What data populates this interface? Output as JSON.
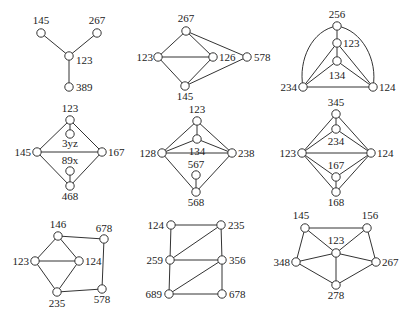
{
  "figure": {
    "node_radius": 4.2,
    "colors": {
      "stroke": "#333333",
      "node_fill": "#ffffff",
      "text": "#222222",
      "background": "#ffffff"
    }
  },
  "graphs": [
    {
      "id": "g1",
      "nodes": [
        {
          "id": "145",
          "x": 41,
          "y": 33,
          "lx": 41,
          "ly": 24,
          "anchor": "middle"
        },
        {
          "id": "267",
          "x": 97,
          "y": 33,
          "lx": 97,
          "ly": 24,
          "anchor": "middle"
        },
        {
          "id": "123",
          "x": 69,
          "y": 56,
          "lx": 76,
          "ly": 64,
          "anchor": "start"
        },
        {
          "id": "389",
          "x": 69,
          "y": 87,
          "lx": 76,
          "ly": 91,
          "anchor": "start"
        }
      ],
      "edges": [
        [
          "145",
          "123"
        ],
        [
          "267",
          "123"
        ],
        [
          "123",
          "389"
        ]
      ],
      "arcs": []
    },
    {
      "id": "g2",
      "nodes": [
        {
          "id": "267",
          "x": 186,
          "y": 31,
          "lx": 186,
          "ly": 22,
          "anchor": "middle"
        },
        {
          "id": "123",
          "x": 158,
          "y": 57,
          "lx": 153,
          "ly": 61,
          "anchor": "end"
        },
        {
          "id": "126",
          "x": 213,
          "y": 57,
          "lx": 219,
          "ly": 61,
          "anchor": "start"
        },
        {
          "id": "578",
          "x": 247,
          "y": 57,
          "lx": 254,
          "ly": 61,
          "anchor": "start"
        },
        {
          "id": "145",
          "x": 185,
          "y": 86,
          "lx": 185,
          "ly": 100,
          "anchor": "middle"
        }
      ],
      "edges": [
        [
          "267",
          "123"
        ],
        [
          "267",
          "126"
        ],
        [
          "267",
          "578"
        ],
        [
          "123",
          "126"
        ],
        [
          "123",
          "145"
        ],
        [
          "126",
          "145"
        ],
        [
          "145",
          "578"
        ]
      ],
      "arcs": []
    },
    {
      "id": "g3",
      "nodes": [
        {
          "id": "256",
          "x": 337,
          "y": 26,
          "lx": 337,
          "ly": 18,
          "anchor": "middle"
        },
        {
          "id": "123",
          "x": 337,
          "y": 43,
          "lx": 343,
          "ly": 47,
          "anchor": "start"
        },
        {
          "id": "134",
          "x": 337,
          "y": 61,
          "lx": 337,
          "ly": 79,
          "anchor": "middle"
        },
        {
          "id": "234",
          "x": 303,
          "y": 87,
          "lx": 297,
          "ly": 91,
          "anchor": "end"
        },
        {
          "id": "124",
          "x": 373,
          "y": 87,
          "lx": 379,
          "ly": 91,
          "anchor": "start"
        }
      ],
      "edges": [
        [
          "256",
          "123"
        ],
        [
          "123",
          "134"
        ],
        [
          "123",
          "234"
        ],
        [
          "123",
          "124"
        ],
        [
          "134",
          "234"
        ],
        [
          "134",
          "124"
        ],
        [
          "234",
          "124"
        ]
      ],
      "arcs": [
        {
          "from": "256",
          "to": "234",
          "path": "M337,26 C312,30 298,60 303,87"
        },
        {
          "from": "256",
          "to": "124",
          "path": "M337,26 C362,30 378,60 373,87"
        }
      ]
    },
    {
      "id": "g4",
      "nodes": [
        {
          "id": "123",
          "x": 70,
          "y": 120,
          "lx": 70,
          "ly": 112,
          "anchor": "middle"
        },
        {
          "id": "3yz",
          "x": 70,
          "y": 134,
          "lx": 70,
          "ly": 147,
          "anchor": "middle"
        },
        {
          "id": "145",
          "x": 37,
          "y": 152,
          "lx": 31,
          "ly": 156,
          "anchor": "end"
        },
        {
          "id": "167",
          "x": 102,
          "y": 152,
          "lx": 108,
          "ly": 156,
          "anchor": "start"
        },
        {
          "id": "89x",
          "x": 70,
          "y": 171,
          "lx": 70,
          "ly": 164,
          "anchor": "middle"
        },
        {
          "id": "468",
          "x": 70,
          "y": 186,
          "lx": 70,
          "ly": 200,
          "anchor": "middle"
        }
      ],
      "edges": [
        [
          "123",
          "3yz"
        ],
        [
          "123",
          "145"
        ],
        [
          "123",
          "167"
        ],
        [
          "145",
          "167"
        ],
        [
          "145",
          "468"
        ],
        [
          "167",
          "468"
        ],
        [
          "89x",
          "468"
        ]
      ],
      "arcs": []
    },
    {
      "id": "g5",
      "nodes": [
        {
          "id": "123",
          "x": 197,
          "y": 121,
          "lx": 197,
          "ly": 113,
          "anchor": "middle"
        },
        {
          "id": "134",
          "x": 197,
          "y": 139,
          "lx": 197,
          "ly": 155,
          "anchor": "middle"
        },
        {
          "id": "128",
          "x": 162,
          "y": 153,
          "lx": 156,
          "ly": 157,
          "anchor": "end"
        },
        {
          "id": "238",
          "x": 232,
          "y": 153,
          "lx": 238,
          "ly": 157,
          "anchor": "start"
        },
        {
          "id": "567",
          "x": 196,
          "y": 175,
          "lx": 196,
          "ly": 168,
          "anchor": "middle"
        },
        {
          "id": "568",
          "x": 196,
          "y": 192,
          "lx": 196,
          "ly": 206,
          "anchor": "middle"
        }
      ],
      "edges": [
        [
          "123",
          "134"
        ],
        [
          "123",
          "128"
        ],
        [
          "123",
          "238"
        ],
        [
          "134",
          "128"
        ],
        [
          "134",
          "238"
        ],
        [
          "128",
          "238"
        ],
        [
          "128",
          "568"
        ],
        [
          "238",
          "568"
        ],
        [
          "567",
          "568"
        ]
      ],
      "arcs": []
    },
    {
      "id": "g6",
      "nodes": [
        {
          "id": "345",
          "x": 336,
          "y": 114,
          "lx": 336,
          "ly": 106,
          "anchor": "middle"
        },
        {
          "id": "234",
          "x": 336,
          "y": 129,
          "lx": 336,
          "ly": 145,
          "anchor": "middle"
        },
        {
          "id": "123",
          "x": 302,
          "y": 153,
          "lx": 296,
          "ly": 157,
          "anchor": "end"
        },
        {
          "id": "124",
          "x": 371,
          "y": 153,
          "lx": 377,
          "ly": 157,
          "anchor": "start"
        },
        {
          "id": "167",
          "x": 336,
          "y": 177,
          "lx": 336,
          "ly": 169,
          "anchor": "middle"
        },
        {
          "id": "168",
          "x": 336,
          "y": 192,
          "lx": 336,
          "ly": 206,
          "anchor": "middle"
        }
      ],
      "edges": [
        [
          "345",
          "234"
        ],
        [
          "345",
          "123"
        ],
        [
          "345",
          "124"
        ],
        [
          "234",
          "123"
        ],
        [
          "234",
          "124"
        ],
        [
          "123",
          "124"
        ],
        [
          "123",
          "167"
        ],
        [
          "124",
          "167"
        ],
        [
          "123",
          "168"
        ],
        [
          "124",
          "168"
        ],
        [
          "167",
          "168"
        ]
      ],
      "arcs": []
    },
    {
      "id": "g7",
      "nodes": [
        {
          "id": "146",
          "x": 58,
          "y": 236,
          "lx": 58,
          "ly": 228,
          "anchor": "middle"
        },
        {
          "id": "678",
          "x": 104,
          "y": 239,
          "lx": 104,
          "ly": 232,
          "anchor": "middle"
        },
        {
          "id": "123",
          "x": 35,
          "y": 261,
          "lx": 29,
          "ly": 265,
          "anchor": "end"
        },
        {
          "id": "124",
          "x": 79,
          "y": 261,
          "lx": 85,
          "ly": 265,
          "anchor": "start"
        },
        {
          "id": "235",
          "x": 57,
          "y": 292,
          "lx": 57,
          "ly": 307,
          "anchor": "middle"
        },
        {
          "id": "578",
          "x": 102,
          "y": 289,
          "lx": 102,
          "ly": 303,
          "anchor": "middle"
        }
      ],
      "edges": [
        [
          "146",
          "123"
        ],
        [
          "146",
          "124"
        ],
        [
          "146",
          "678"
        ],
        [
          "123",
          "124"
        ],
        [
          "123",
          "235"
        ],
        [
          "124",
          "235"
        ],
        [
          "678",
          "578"
        ],
        [
          "235",
          "578"
        ]
      ],
      "arcs": []
    },
    {
      "id": "g8",
      "nodes": [
        {
          "id": "124",
          "x": 171,
          "y": 225,
          "lx": 164,
          "ly": 229,
          "anchor": "end"
        },
        {
          "id": "235",
          "x": 221,
          "y": 225,
          "lx": 228,
          "ly": 229,
          "anchor": "start"
        },
        {
          "id": "259",
          "x": 170,
          "y": 260,
          "lx": 163,
          "ly": 264,
          "anchor": "end"
        },
        {
          "id": "356",
          "x": 222,
          "y": 260,
          "lx": 229,
          "ly": 264,
          "anchor": "start"
        },
        {
          "id": "689",
          "x": 169,
          "y": 294,
          "lx": 162,
          "ly": 298,
          "anchor": "end"
        },
        {
          "id": "678",
          "x": 222,
          "y": 294,
          "lx": 229,
          "ly": 298,
          "anchor": "start"
        }
      ],
      "edges": [
        [
          "124",
          "235"
        ],
        [
          "124",
          "259"
        ],
        [
          "235",
          "259"
        ],
        [
          "235",
          "356"
        ],
        [
          "259",
          "356"
        ],
        [
          "259",
          "689"
        ],
        [
          "356",
          "689"
        ],
        [
          "356",
          "678"
        ],
        [
          "689",
          "678"
        ]
      ],
      "arcs": []
    },
    {
      "id": "g9",
      "nodes": [
        {
          "id": "145",
          "x": 305,
          "y": 228,
          "lx": 301,
          "ly": 219,
          "anchor": "middle"
        },
        {
          "id": "156",
          "x": 367,
          "y": 228,
          "lx": 370,
          "ly": 219,
          "anchor": "middle"
        },
        {
          "id": "123",
          "x": 336,
          "y": 253,
          "lx": 336,
          "ly": 244,
          "anchor": "middle"
        },
        {
          "id": "348",
          "x": 296,
          "y": 262,
          "lx": 290,
          "ly": 266,
          "anchor": "end"
        },
        {
          "id": "267",
          "x": 376,
          "y": 262,
          "lx": 382,
          "ly": 266,
          "anchor": "start"
        },
        {
          "id": "278",
          "x": 336,
          "y": 285,
          "lx": 336,
          "ly": 299,
          "anchor": "middle"
        }
      ],
      "edges": [
        [
          "145",
          "156"
        ],
        [
          "145",
          "123"
        ],
        [
          "145",
          "348"
        ],
        [
          "156",
          "123"
        ],
        [
          "156",
          "267"
        ],
        [
          "123",
          "348"
        ],
        [
          "123",
          "267"
        ],
        [
          "123",
          "278"
        ],
        [
          "348",
          "278"
        ],
        [
          "267",
          "278"
        ]
      ],
      "arcs": []
    }
  ]
}
